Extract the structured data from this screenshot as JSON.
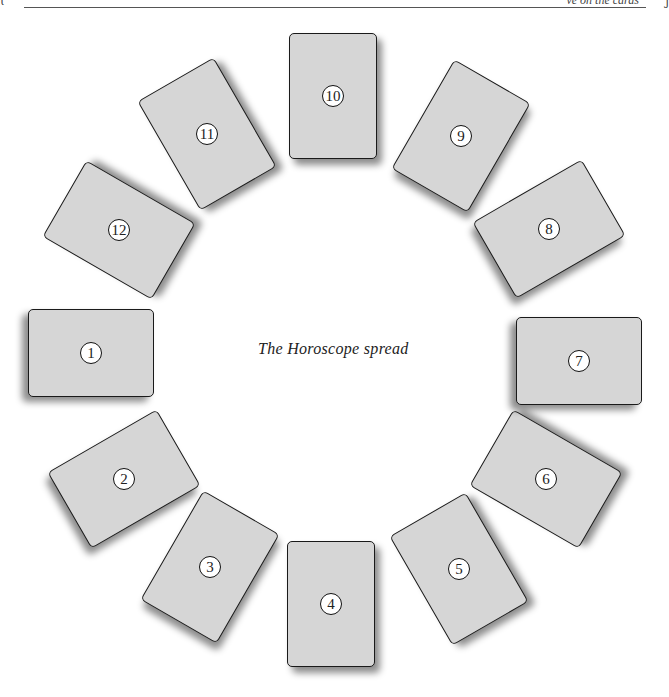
{
  "header": {
    "text": "ve on the cards"
  },
  "caption": "The Horoscope spread",
  "colors": {
    "card_fill": "#d6d6d6",
    "card_border": "#1a1a1a",
    "number_fill": "#ffffff"
  },
  "cards": [
    {
      "label": "1",
      "cx": 91,
      "cy": 353,
      "rotate": 90
    },
    {
      "label": "2",
      "cx": 124,
      "cy": 479,
      "rotate": 60
    },
    {
      "label": "3",
      "cx": 210,
      "cy": 567,
      "rotate": 30
    },
    {
      "label": "4",
      "cx": 331,
      "cy": 604,
      "rotate": 0
    },
    {
      "label": "5",
      "cx": 459,
      "cy": 569,
      "rotate": -30
    },
    {
      "label": "6",
      "cx": 546,
      "cy": 479,
      "rotate": -60
    },
    {
      "label": "7",
      "cx": 579,
      "cy": 361,
      "rotate": 90
    },
    {
      "label": "8",
      "cx": 549,
      "cy": 229,
      "rotate": 60
    },
    {
      "label": "9",
      "cx": 461,
      "cy": 136,
      "rotate": 30
    },
    {
      "label": "10",
      "cx": 333,
      "cy": 96,
      "rotate": 0
    },
    {
      "label": "11",
      "cx": 207,
      "cy": 134,
      "rotate": -30
    },
    {
      "label": "12",
      "cx": 119,
      "cy": 230,
      "rotate": -60
    }
  ]
}
